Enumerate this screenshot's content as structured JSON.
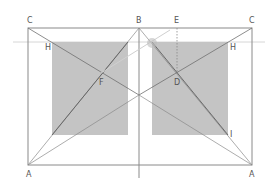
{
  "diagram": {
    "title": "",
    "colors": {
      "frame": "#8a8a8a",
      "shade": "#c4c4c4",
      "line": "#707070",
      "faint": "#d0d0d0"
    },
    "labels": {
      "C_left": "C",
      "B": "B",
      "E": "E",
      "C_right": "C",
      "H_left": "H",
      "H_right": "H",
      "F": "F",
      "D": "D",
      "I": "I",
      "A_left": "A",
      "A_right": "A"
    }
  }
}
